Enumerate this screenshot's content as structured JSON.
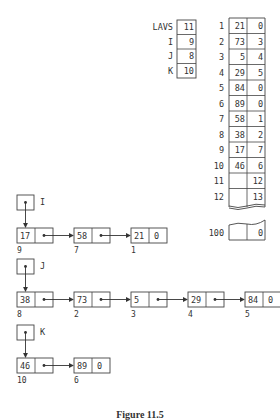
{
  "caption": "Figure 11.5",
  "pointers": {
    "title_lavs": "LAVS",
    "rows": [
      {
        "name": "LAVS",
        "value": "11"
      },
      {
        "name": "I",
        "value": "9"
      },
      {
        "name": "J",
        "value": "8"
      },
      {
        "name": "K",
        "value": "10"
      }
    ]
  },
  "memory_table": {
    "rows": [
      {
        "index": "1",
        "info": "21",
        "link": "0"
      },
      {
        "index": "2",
        "info": "73",
        "link": "3"
      },
      {
        "index": "3",
        "info": "5",
        "link": "4"
      },
      {
        "index": "4",
        "info": "29",
        "link": "5"
      },
      {
        "index": "5",
        "info": "84",
        "link": "0"
      },
      {
        "index": "6",
        "info": "89",
        "link": "0"
      },
      {
        "index": "7",
        "info": "58",
        "link": "1"
      },
      {
        "index": "8",
        "info": "38",
        "link": "2"
      },
      {
        "index": "9",
        "info": "17",
        "link": "7"
      },
      {
        "index": "10",
        "info": "46",
        "link": "6"
      },
      {
        "index": "11",
        "info": "",
        "link": "12"
      },
      {
        "index": "12",
        "info": "",
        "link": "13"
      }
    ],
    "last_row": {
      "index": "100",
      "info": "",
      "link": "0"
    }
  },
  "lists": [
    {
      "head": "I",
      "nodes": [
        {
          "info": "17",
          "addr": "9",
          "link": "•"
        },
        {
          "info": "58",
          "addr": "7",
          "link": "•"
        },
        {
          "info": "21",
          "addr": "1",
          "link": "0"
        }
      ]
    },
    {
      "head": "J",
      "nodes": [
        {
          "info": "38",
          "addr": "8",
          "link": "•"
        },
        {
          "info": "73",
          "addr": "2",
          "link": "•"
        },
        {
          "info": "5",
          "addr": "3",
          "link": "•"
        },
        {
          "info": "29",
          "addr": "4",
          "link": "•"
        },
        {
          "info": "84",
          "addr": "5",
          "link": "0"
        }
      ]
    },
    {
      "head": "K",
      "nodes": [
        {
          "info": "46",
          "addr": "10",
          "link": "•"
        },
        {
          "info": "89",
          "addr": "6",
          "link": "0"
        }
      ]
    }
  ]
}
